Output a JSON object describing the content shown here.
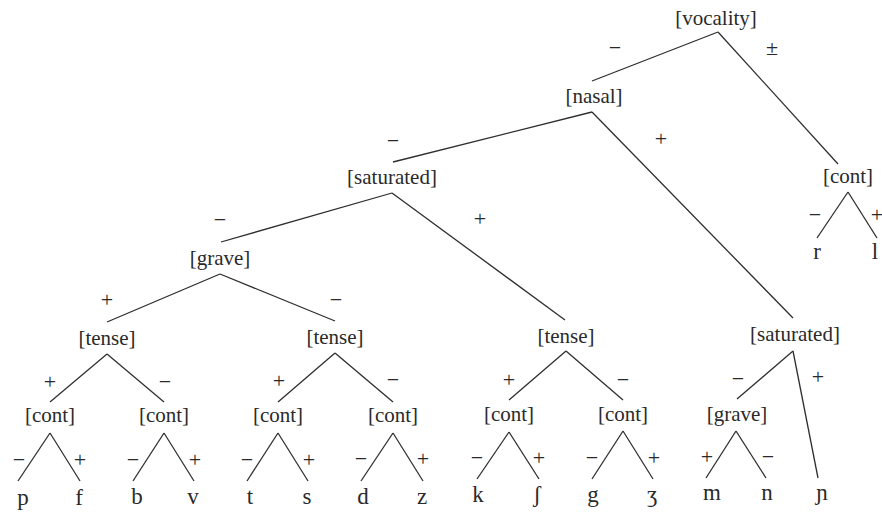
{
  "diagram": {
    "type": "feature-tree",
    "colors": {
      "ink": "#2a2a2a",
      "background": "#ffffff"
    },
    "nodes": [
      {
        "id": "vocality",
        "label": "[vocality]",
        "x": 716,
        "y": 25
      },
      {
        "id": "nasal",
        "label": "[nasal]",
        "x": 594,
        "y": 103
      },
      {
        "id": "cont_rl",
        "label": "[cont]",
        "x": 848,
        "y": 183
      },
      {
        "id": "saturated_1",
        "label": "[saturated]",
        "x": 392,
        "y": 184
      },
      {
        "id": "grave_1",
        "label": "[grave]",
        "x": 220,
        "y": 265
      },
      {
        "id": "tense_1",
        "label": "[tense]",
        "x": 107,
        "y": 345
      },
      {
        "id": "tense_2",
        "label": "[tense]",
        "x": 335,
        "y": 344
      },
      {
        "id": "tense_3",
        "label": "[tense]",
        "x": 566,
        "y": 343
      },
      {
        "id": "saturated_2",
        "label": "[saturated]",
        "x": 795,
        "y": 341
      },
      {
        "id": "cont_pf",
        "label": "[cont]",
        "x": 50,
        "y": 422
      },
      {
        "id": "cont_bv",
        "label": "[cont]",
        "x": 164,
        "y": 422
      },
      {
        "id": "cont_ts",
        "label": "[cont]",
        "x": 278,
        "y": 422
      },
      {
        "id": "cont_dz",
        "label": "[cont]",
        "x": 393,
        "y": 422
      },
      {
        "id": "cont_kS",
        "label": "[cont]",
        "x": 509,
        "y": 421
      },
      {
        "id": "cont_gZ",
        "label": "[cont]",
        "x": 623,
        "y": 421
      },
      {
        "id": "grave_2",
        "label": "[grave]",
        "x": 737,
        "y": 421
      }
    ],
    "leaves": [
      {
        "id": "p",
        "label": "p",
        "x": 23,
        "y": 505
      },
      {
        "id": "f",
        "label": "f",
        "x": 79,
        "y": 505
      },
      {
        "id": "b",
        "label": "b",
        "x": 137,
        "y": 504
      },
      {
        "id": "v",
        "label": "v",
        "x": 193,
        "y": 504
      },
      {
        "id": "t",
        "label": "t",
        "x": 250,
        "y": 504
      },
      {
        "id": "s",
        "label": "s",
        "x": 307,
        "y": 504
      },
      {
        "id": "d",
        "label": "d",
        "x": 363,
        "y": 504
      },
      {
        "id": "z",
        "label": "z",
        "x": 422,
        "y": 504
      },
      {
        "id": "k",
        "label": "k",
        "x": 478,
        "y": 502
      },
      {
        "id": "esh",
        "label": "ʃ",
        "x": 537,
        "y": 502
      },
      {
        "id": "g",
        "label": "g",
        "x": 593,
        "y": 502
      },
      {
        "id": "ezh",
        "label": "ʒ",
        "x": 652,
        "y": 502
      },
      {
        "id": "m",
        "label": "m",
        "x": 712,
        "y": 500
      },
      {
        "id": "n",
        "label": "n",
        "x": 767,
        "y": 500
      },
      {
        "id": "palatal_n",
        "label": "ɲ",
        "x": 822,
        "y": 500
      },
      {
        "id": "r",
        "label": "r",
        "x": 817,
        "y": 259
      },
      {
        "id": "l",
        "label": "l",
        "x": 875,
        "y": 259
      }
    ],
    "edges": [
      {
        "from": "vocality",
        "x1": 718,
        "y1": 32,
        "x2": 592,
        "y2": 81,
        "sign": "−",
        "sx": 615,
        "sy": 55
      },
      {
        "from": "vocality",
        "x1": 718,
        "y1": 32,
        "x2": 838,
        "y2": 164,
        "sign": "±",
        "sx": 772,
        "sy": 55
      },
      {
        "from": "nasal",
        "x1": 592,
        "y1": 112,
        "x2": 393,
        "y2": 162,
        "sign": "−",
        "sx": 393,
        "sy": 148
      },
      {
        "from": "nasal",
        "x1": 592,
        "y1": 112,
        "x2": 793,
        "y2": 318,
        "sign": "+",
        "sx": 661,
        "sy": 146
      },
      {
        "from": "saturated_1",
        "x1": 392,
        "y1": 193,
        "x2": 221,
        "y2": 242,
        "sign": "−",
        "sx": 220,
        "sy": 227
      },
      {
        "from": "saturated_1",
        "x1": 392,
        "y1": 193,
        "x2": 565,
        "y2": 320,
        "sign": "+",
        "sx": 480,
        "sy": 226
      },
      {
        "from": "grave_1",
        "x1": 220,
        "y1": 274,
        "x2": 107,
        "y2": 322,
        "sign": "+",
        "sx": 107,
        "sy": 307
      },
      {
        "from": "grave_1",
        "x1": 220,
        "y1": 274,
        "x2": 335,
        "y2": 321,
        "sign": "−",
        "sx": 336,
        "sy": 307
      },
      {
        "from": "tense_1",
        "x1": 107,
        "y1": 354,
        "x2": 50,
        "y2": 402,
        "sign": "+",
        "sx": 50,
        "sy": 389
      },
      {
        "from": "tense_1",
        "x1": 107,
        "y1": 354,
        "x2": 164,
        "y2": 402,
        "sign": "−",
        "sx": 165,
        "sy": 389
      },
      {
        "from": "tense_2",
        "x1": 335,
        "y1": 353,
        "x2": 278,
        "y2": 402,
        "sign": "+",
        "sx": 279,
        "sy": 388
      },
      {
        "from": "tense_2",
        "x1": 335,
        "y1": 353,
        "x2": 393,
        "y2": 402,
        "sign": "−",
        "sx": 393,
        "sy": 387
      },
      {
        "from": "tense_3",
        "x1": 566,
        "y1": 351,
        "x2": 509,
        "y2": 400,
        "sign": "+",
        "sx": 509,
        "sy": 387
      },
      {
        "from": "tense_3",
        "x1": 566,
        "y1": 351,
        "x2": 623,
        "y2": 400,
        "sign": "−",
        "sx": 623,
        "sy": 387
      },
      {
        "from": "saturated_2",
        "x1": 793,
        "y1": 351,
        "x2": 737,
        "y2": 399,
        "sign": "−",
        "sx": 738,
        "sy": 386
      },
      {
        "from": "saturated_2",
        "x1": 793,
        "y1": 351,
        "x2": 818,
        "y2": 478,
        "sign": "+",
        "sx": 818,
        "sy": 384
      },
      {
        "from": "cont_rl",
        "x1": 848,
        "y1": 192,
        "x2": 817,
        "y2": 238,
        "sign": "−",
        "sx": 815,
        "sy": 222
      },
      {
        "from": "cont_rl",
        "x1": 848,
        "y1": 192,
        "x2": 877,
        "y2": 238,
        "sign": "+",
        "sx": 877,
        "sy": 222
      },
      {
        "from": "cont_pf",
        "x1": 50,
        "y1": 433,
        "x2": 18,
        "y2": 481,
        "sign": "−",
        "sx": 19,
        "sy": 467
      },
      {
        "from": "cont_pf",
        "x1": 50,
        "y1": 433,
        "x2": 80,
        "y2": 481,
        "sign": "+",
        "sx": 80,
        "sy": 467
      },
      {
        "from": "cont_bv",
        "x1": 164,
        "y1": 433,
        "x2": 133,
        "y2": 481,
        "sign": "−",
        "sx": 133,
        "sy": 467
      },
      {
        "from": "cont_bv",
        "x1": 164,
        "y1": 433,
        "x2": 194,
        "y2": 481,
        "sign": "+",
        "sx": 195,
        "sy": 467
      },
      {
        "from": "cont_ts",
        "x1": 278,
        "y1": 433,
        "x2": 247,
        "y2": 481,
        "sign": "−",
        "sx": 247,
        "sy": 467
      },
      {
        "from": "cont_ts",
        "x1": 278,
        "y1": 433,
        "x2": 308,
        "y2": 481,
        "sign": "+",
        "sx": 309,
        "sy": 467
      },
      {
        "from": "cont_dz",
        "x1": 393,
        "y1": 433,
        "x2": 361,
        "y2": 481,
        "sign": "−",
        "sx": 361,
        "sy": 466
      },
      {
        "from": "cont_dz",
        "x1": 393,
        "y1": 433,
        "x2": 423,
        "y2": 481,
        "sign": "+",
        "sx": 423,
        "sy": 466
      },
      {
        "from": "cont_kS",
        "x1": 509,
        "y1": 432,
        "x2": 477,
        "y2": 479,
        "sign": "−",
        "sx": 477,
        "sy": 465
      },
      {
        "from": "cont_kS",
        "x1": 509,
        "y1": 432,
        "x2": 539,
        "y2": 479,
        "sign": "+",
        "sx": 539,
        "sy": 465
      },
      {
        "from": "cont_gZ",
        "x1": 623,
        "y1": 431,
        "x2": 592,
        "y2": 479,
        "sign": "−",
        "sx": 592,
        "sy": 465
      },
      {
        "from": "cont_gZ",
        "x1": 623,
        "y1": 431,
        "x2": 653,
        "y2": 479,
        "sign": "+",
        "sx": 654,
        "sy": 465
      },
      {
        "from": "grave_2",
        "x1": 736,
        "y1": 431,
        "x2": 706,
        "y2": 478,
        "sign": "+",
        "sx": 707,
        "sy": 464
      },
      {
        "from": "grave_2",
        "x1": 736,
        "y1": 431,
        "x2": 766,
        "y2": 478,
        "sign": "−",
        "sx": 768,
        "sy": 464
      }
    ]
  }
}
